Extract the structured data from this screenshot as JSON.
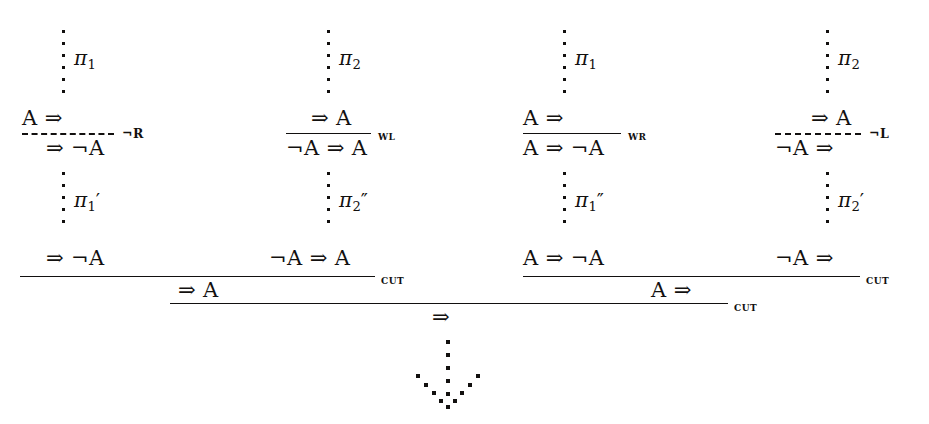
{
  "diagram": {
    "kind": "sequent-calculus-proof-tree",
    "background": "#ffffff",
    "ink": "#12100f",
    "branches": [
      {
        "id": "branch-1",
        "proof_label": "π",
        "proof_sub": "1",
        "proof_prime": "",
        "premise": "A ⇒",
        "conclusion": "⇒ ¬A",
        "rule": "¬R",
        "line_style": "dashed",
        "lower_proof_label": "π",
        "lower_proof_sub": "1",
        "lower_proof_prime": "′",
        "endsequent": "⇒ ¬A"
      },
      {
        "id": "branch-2",
        "proof_label": "π",
        "proof_sub": "2",
        "proof_prime": "",
        "premise": "⇒ A",
        "conclusion": "¬A ⇒ A",
        "rule": "WL",
        "line_style": "solid",
        "lower_proof_label": "π",
        "lower_proof_sub": "2",
        "lower_proof_prime": "″",
        "endsequent": "¬A ⇒ A"
      },
      {
        "id": "branch-3",
        "proof_label": "π",
        "proof_sub": "1",
        "proof_prime": "",
        "premise": "A ⇒",
        "conclusion": "A ⇒ ¬A",
        "rule": "WR",
        "line_style": "solid",
        "lower_proof_label": "π",
        "lower_proof_sub": "1",
        "lower_proof_prime": "″",
        "endsequent": "A ⇒ ¬A"
      },
      {
        "id": "branch-4",
        "proof_label": "π",
        "proof_sub": "2",
        "proof_prime": "",
        "premise": "⇒ A",
        "conclusion": "¬A ⇒",
        "rule": "¬L",
        "line_style": "dashed",
        "lower_proof_label": "π",
        "lower_proof_sub": "2",
        "lower_proof_prime": "′",
        "endsequent": "¬A ⇒"
      }
    ],
    "cuts": [
      {
        "id": "cut-left",
        "label": "CUT",
        "conclusion": "⇒ A"
      },
      {
        "id": "cut-right",
        "label": "CUT",
        "conclusion": "A ⇒"
      },
      {
        "id": "cut-final",
        "label": "CUT",
        "conclusion": "⇒"
      }
    ],
    "bottom_arrow": {
      "name": "dotted-down-arrow",
      "style": "dotted"
    }
  }
}
